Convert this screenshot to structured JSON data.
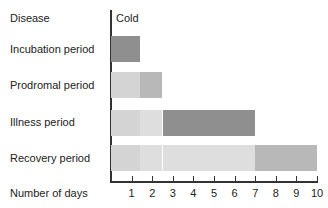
{
  "chart_data": {
    "type": "bar",
    "orientation": "horizontal-stacked-timeline",
    "title": "Cold",
    "ylabel": "Disease",
    "xlabel": "Number of days",
    "xlim": [
      0,
      10
    ],
    "x_ticks": [
      "1",
      "2",
      "3",
      "4",
      "5",
      "6",
      "7",
      "8",
      "9",
      "10"
    ],
    "grid": false,
    "categories": [
      "Incubation period",
      "Prodromal period",
      "Illness period",
      "Recovery period"
    ],
    "series": [
      {
        "name": "Incubation period",
        "segments": [
          {
            "start": 0,
            "end": 1.4,
            "shade": "dark"
          }
        ]
      },
      {
        "name": "Prodromal period",
        "segments": [
          {
            "start": 0,
            "end": 1.4,
            "shade": "light"
          },
          {
            "start": 1.4,
            "end": 2.5,
            "shade": "medium"
          }
        ]
      },
      {
        "name": "Illness period",
        "segments": [
          {
            "start": 0,
            "end": 1.4,
            "shade": "light"
          },
          {
            "start": 1.4,
            "end": 2.5,
            "shade": "lighter"
          },
          {
            "start": 2.5,
            "end": 7,
            "shade": "dark"
          }
        ]
      },
      {
        "name": "Recovery period",
        "segments": [
          {
            "start": 0,
            "end": 1.4,
            "shade": "light"
          },
          {
            "start": 1.4,
            "end": 2.5,
            "shade": "lighter"
          },
          {
            "start": 2.5,
            "end": 7,
            "shade": "lighter"
          },
          {
            "start": 7,
            "end": 10,
            "shade": "medium"
          }
        ]
      }
    ]
  },
  "labels": {
    "header": "Disease",
    "disease": "Cold",
    "rows": [
      "Incubation period",
      "Prodromal period",
      "Illness period",
      "Recovery period"
    ],
    "xaxis": "Number of days",
    "ticks": [
      "1",
      "2",
      "3",
      "4",
      "5",
      "6",
      "7",
      "8",
      "9",
      "10"
    ]
  },
  "colors": {
    "dark": "#8f8f8f",
    "medium": "#b8b8b8",
    "light": "#d4d4d4",
    "lighter": "#dedede"
  }
}
